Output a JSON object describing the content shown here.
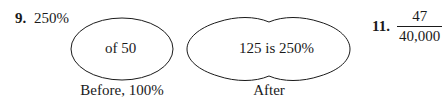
{
  "problems": [
    {
      "number": "9.",
      "answer": "250%",
      "diagram": {
        "before": {
          "inner_text": "of 50",
          "caption": "Before, 100%"
        },
        "after": {
          "inner_text": "125 is 250%",
          "caption": "After"
        }
      }
    },
    {
      "number": "11.",
      "fraction": {
        "numerator": "47",
        "denominator": "40,000"
      }
    }
  ],
  "colors": {
    "ink": "#1a1a1a",
    "background": "#ffffff"
  }
}
